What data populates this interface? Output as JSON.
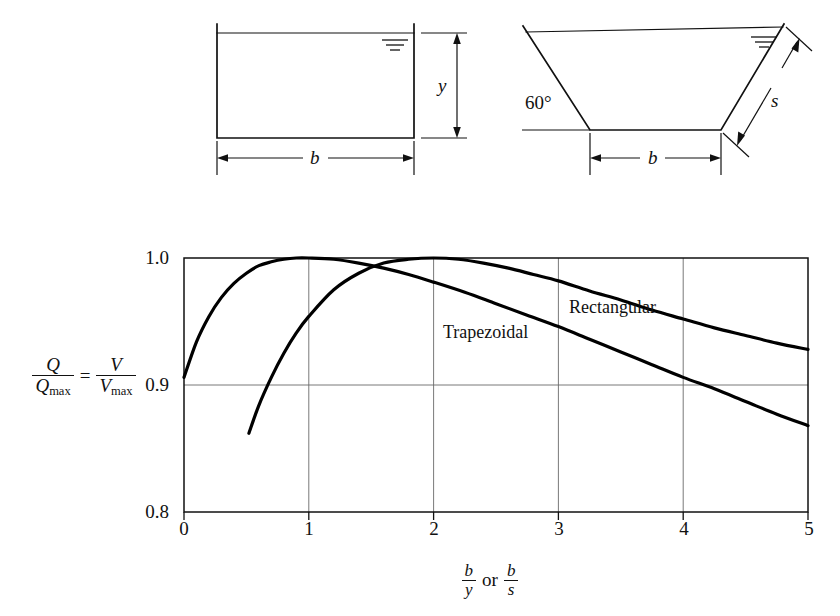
{
  "figure": {
    "title": "",
    "background_color": "#ffffff",
    "line_color": "#111111"
  },
  "diagrams": {
    "rectangular": {
      "name": "Rectangular channel cross-section",
      "depth_label": "y",
      "width_label": "b",
      "water_surface_symbol": "water-surface-hatch"
    },
    "trapezoidal": {
      "name": "Trapezoidal channel cross-section",
      "angle_label": "60°",
      "side_label": "s",
      "width_label": "b",
      "water_surface_symbol": "water-surface-hatch"
    }
  },
  "chart_data": {
    "type": "line",
    "title": "",
    "xlabel_parts": {
      "num1": "b",
      "den1": "y",
      "conjunction": "or",
      "num2": "b",
      "den2": "s"
    },
    "ylabel_parts": {
      "num1": "Q",
      "den1": "Q",
      "den1_sub": "max",
      "equals": "=",
      "num2": "V",
      "den2": "V",
      "den2_sub": "max"
    },
    "xlim": [
      0,
      5
    ],
    "ylim": [
      0.8,
      1.0
    ],
    "xticks": [
      0,
      1,
      2,
      3,
      4,
      5
    ],
    "xticklabels": [
      "0",
      "1",
      "2",
      "3",
      "4",
      "5"
    ],
    "yticks": [
      0.8,
      0.9,
      1.0
    ],
    "yticklabels": [
      "0.8",
      "0.9",
      "1.0"
    ],
    "grid": {
      "vertical_at": [
        1,
        2,
        3,
        4
      ],
      "horizontal_at": [
        0.9
      ],
      "color": "#6a6a6a"
    },
    "legend_position": "inline-annotations",
    "series": [
      {
        "name": "Trapezoidal",
        "label_x": 2.15,
        "label_y": 0.962,
        "peak_x": 1.0,
        "peak_y": 1.0,
        "x": [
          0.0,
          0.1,
          0.2,
          0.3,
          0.4,
          0.5,
          0.6,
          0.7,
          0.8,
          0.9,
          1.0,
          1.2,
          1.4,
          1.6,
          1.8,
          2.0,
          2.25,
          2.5,
          2.75,
          3.0,
          3.25,
          3.5,
          3.75,
          4.0,
          4.25,
          4.5,
          4.75,
          5.0
        ],
        "y": [
          0.906,
          0.934,
          0.954,
          0.969,
          0.98,
          0.988,
          0.994,
          0.997,
          0.999,
          1.0,
          1.0,
          0.999,
          0.996,
          0.992,
          0.987,
          0.981,
          0.973,
          0.964,
          0.955,
          0.946,
          0.936,
          0.926,
          0.916,
          0.906,
          0.897,
          0.887,
          0.877,
          0.868
        ]
      },
      {
        "name": "Rectangular",
        "label_x": 3.05,
        "label_y": 0.977,
        "peak_x": 2.0,
        "peak_y": 1.0,
        "x": [
          0.52,
          0.6,
          0.7,
          0.8,
          0.9,
          1.0,
          1.2,
          1.4,
          1.6,
          1.8,
          2.0,
          2.2,
          2.4,
          2.6,
          2.8,
          3.0,
          3.25,
          3.5,
          3.75,
          4.0,
          4.25,
          4.5,
          4.75,
          5.0
        ],
        "y": [
          0.862,
          0.884,
          0.906,
          0.925,
          0.941,
          0.954,
          0.975,
          0.988,
          0.996,
          0.999,
          1.0,
          0.999,
          0.996,
          0.992,
          0.987,
          0.982,
          0.974,
          0.967,
          0.959,
          0.952,
          0.945,
          0.939,
          0.933,
          0.928
        ]
      }
    ]
  }
}
